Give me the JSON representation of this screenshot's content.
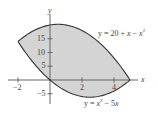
{
  "chart_data": {
    "type": "area",
    "title": "",
    "xlabel": "x",
    "ylabel": "y",
    "xlim": [
      -2.6,
      6
    ],
    "ylim": [
      -7.5,
      22
    ],
    "grid": false,
    "x_ticks": [
      -2,
      2,
      4
    ],
    "x_tick_labels": [
      "−2",
      "2",
      "4"
    ],
    "y_ticks": [
      -5,
      5,
      10,
      15
    ],
    "y_tick_labels": [
      "−5",
      "5",
      "10",
      "15"
    ],
    "series": [
      {
        "name": "y = 20 + x − x²",
        "expr": "20 + x - x^2",
        "x": [
          -2,
          -1,
          0,
          0.5,
          1,
          2,
          3,
          4,
          5
        ],
        "values": [
          14,
          18,
          20,
          20.25,
          20,
          18,
          14,
          8,
          0
        ]
      },
      {
        "name": "y = x² − 5x",
        "expr": "x^2 - 5x",
        "x": [
          -2,
          -1,
          0,
          1,
          2,
          2.5,
          3,
          4,
          5
        ],
        "values": [
          14,
          6,
          0,
          -4,
          -6,
          -6.25,
          -6,
          -4,
          0
        ]
      }
    ],
    "shaded_region": {
      "between": [
        "y = 20 + x − x²",
        "y = x² − 5x"
      ],
      "x_range": [
        -2,
        5
      ],
      "color": "#d4d4d4"
    },
    "intersections": [
      [
        -2,
        14
      ],
      [
        5,
        0
      ]
    ],
    "annotations": [
      {
        "text": "y = 20 + x − x²",
        "near": [
          4,
          18
        ]
      },
      {
        "text": "y = x² − 5x",
        "near": [
          3.5,
          -8
        ]
      }
    ]
  },
  "colors": {
    "fill": "#d4d4d4",
    "curve": "#333333",
    "axis": "#666666",
    "text": "#444444"
  },
  "labels": {
    "x_axis": "x",
    "y_axis": "y",
    "upper_curve_prefix": "y = 20 + ",
    "upper_curve_x": "x",
    "upper_curve_minus": " − ",
    "upper_curve_x2": "x",
    "upper_curve_sup": "2",
    "lower_curve_prefix": "y = ",
    "lower_curve_x": "x",
    "lower_curve_sup": "2",
    "lower_curve_mid": " − 5",
    "lower_curve_x2": "x"
  }
}
